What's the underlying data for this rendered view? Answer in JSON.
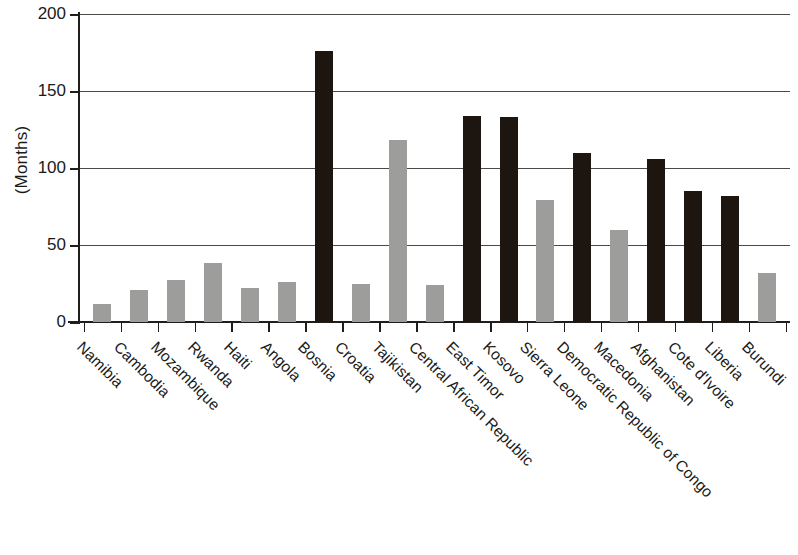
{
  "chart_data": {
    "type": "bar",
    "title": "",
    "subtitle": "",
    "xlabel": "",
    "ylabel": "(Months)",
    "ylim": [
      0,
      200
    ],
    "ytick_values": [
      0,
      50,
      100,
      150,
      200
    ],
    "ytick_labels": [
      "0",
      "50",
      "100",
      "150",
      "200"
    ],
    "grid": true,
    "legend": null,
    "categories": [
      "Namibia",
      "Cambodia",
      "Mozambique",
      "Rwanda",
      "Haiti",
      "Angola",
      "Bosnia",
      "Croatia",
      "Tajikistan",
      "Central African Republic",
      "East Timor",
      "Kosovo",
      "Sierra Leone",
      "Democratic Republic of Congo",
      "Macedonia",
      "Afghanistan",
      "Cote d'Ivoire",
      "Liberia",
      "Burundi"
    ],
    "values": [
      12,
      21,
      27,
      38,
      22,
      26,
      176,
      25,
      118,
      24,
      134,
      133,
      79,
      110,
      60,
      106,
      85,
      82,
      32
    ],
    "bar_colors": [
      "light",
      "light",
      "light",
      "light",
      "light",
      "light",
      "dark",
      "light",
      "light",
      "light",
      "dark",
      "dark",
      "light",
      "dark",
      "light",
      "dark",
      "dark",
      "dark",
      "light"
    ],
    "colors": {
      "dark": "#1c1510",
      "light": "#9d9d9b",
      "gridline": "#4d4a46",
      "axis": "#201d1a",
      "background": "#ffffff"
    }
  }
}
